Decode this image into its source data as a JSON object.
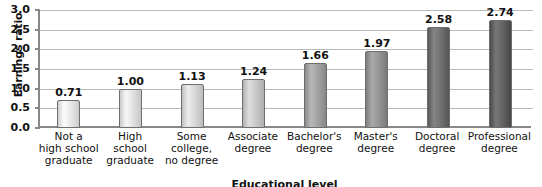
{
  "chart_data": {
    "type": "bar",
    "title": "",
    "xlabel": "Educational level",
    "ylabel": "Earnings ratio",
    "ylim": [
      0,
      3.0
    ],
    "ytick_step": 0.5,
    "grid": true,
    "legend": "none",
    "categories": [
      "Not a high school graduate",
      "High school graduate",
      "Some college, no degree",
      "Associate degree",
      "Bachelor's degree",
      "Master's degree",
      "Doctoral degree",
      "Professional degree"
    ],
    "category_lines": [
      [
        "Not a",
        "high school",
        "graduate"
      ],
      [
        "High",
        "school",
        "graduate"
      ],
      [
        "Some",
        "college,",
        "no degree"
      ],
      [
        "Associate",
        "degree"
      ],
      [
        "Bachelor's",
        "degree"
      ],
      [
        "Master's",
        "degree"
      ],
      [
        "Doctoral",
        "degree"
      ],
      [
        "Professional",
        "degree"
      ]
    ],
    "values": [
      0.71,
      1.0,
      1.13,
      1.24,
      1.66,
      1.97,
      2.58,
      2.74
    ],
    "value_labels": [
      "0.71",
      "1.00",
      "1.13",
      "1.24",
      "1.66",
      "1.97",
      "2.58",
      "2.74"
    ],
    "ytick_labels": [
      "0.0",
      "0.5",
      "1.0",
      "1.5",
      "2.0",
      "2.5",
      "3.0"
    ],
    "ytick_values": [
      0.0,
      0.5,
      1.0,
      1.5,
      2.0,
      2.5,
      3.0
    ],
    "bar_colors": [
      "#e2e2e2",
      "#dcdcdc",
      "#d2d2d2",
      "#c4c4c4",
      "#9d9d9d",
      "#8f8f8f",
      "#6b6b6b",
      "#5d5d5d"
    ],
    "axis_color": "#888888",
    "grid_color": "#b9b9b9",
    "background": "#ffffff"
  }
}
